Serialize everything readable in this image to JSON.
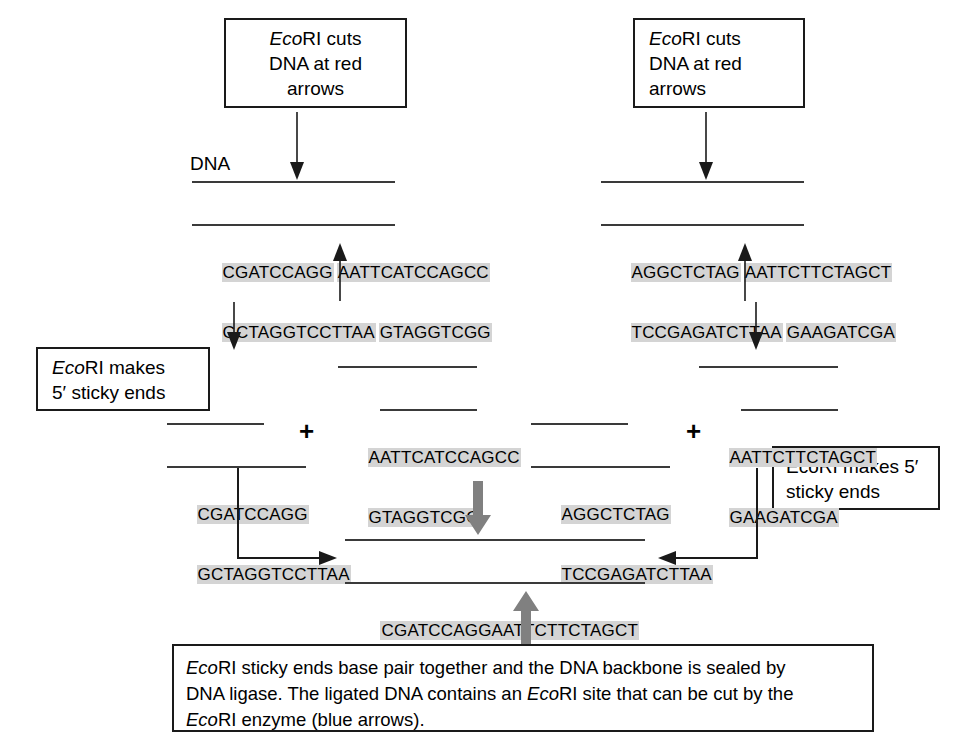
{
  "figure": {
    "title_label": "DNA",
    "colors": {
      "ink": "#1a1a1a",
      "sequence_highlight": "#d4d4d4",
      "thick_arrow": "#808080",
      "backbone": "#3a3a3a"
    }
  },
  "boxes": {
    "top_left": {
      "line1_italic": "Eco",
      "line1_rest": "RI cuts",
      "line2": "DNA at red",
      "line3": "arrows"
    },
    "top_right": {
      "line1_italic": "Eco",
      "line1_rest": "RI cuts",
      "line2": "DNA at red",
      "line3": "arrows"
    },
    "left_middle": {
      "line1_italic": "Eco",
      "line1_rest": "RI makes",
      "line2": "5′ sticky ends"
    },
    "right_middle": {
      "line1": "EcoRI makes 5′",
      "line2": "sticky ends"
    },
    "caption": {
      "l1_italic": "Eco",
      "l1_a": "RI sticky ends base pair together and the DNA backbone is sealed by",
      "l2_a": "DNA ligase. The ligated DNA contains an ",
      "l2_italic": "Eco",
      "l2_b": "RI site that can be cut by the",
      "l3_italic": "Eco",
      "l3_a": "RI enzyme (blue arrows)."
    }
  },
  "sequences": {
    "top_left_duplex": {
      "label": "DNA",
      "top_left_part": "CGATCCAGG",
      "top_right_part": "AATTCATCCAGCC",
      "bottom_left_part": "GCTAGGTCCTTAA",
      "bottom_right_part": "GTAGGTCGG"
    },
    "top_right_duplex": {
      "top_left_part": "AGGCTCTAG",
      "top_right_part": "AATTCTTCTAGCT",
      "bottom_left_part": "TCCGAGATCTTAA",
      "bottom_right_part": "GAAGATCGA"
    },
    "fragment_left_sticky": {
      "top": "AATTCATCCAGCC",
      "bottom": "GTAGGTCGG"
    },
    "fragment_right_sticky": {
      "top": "AATTCTTCTAGCT",
      "bottom": "GAAGATCGA"
    },
    "fragment_left_blunt": {
      "top": "CGATCCAGG",
      "bottom": "GCTAGGTCCTTAA"
    },
    "fragment_right_blunt": {
      "top": "AGGCTCTAG",
      "bottom": "TCCGAGATCTTAA"
    },
    "ligated": {
      "top": "CGATCCAGGAATTCTTCTAGCT",
      "bottom": "GCTAGGTCCTTAAGAAGATCGA"
    }
  },
  "symbols": {
    "plus_left": "+",
    "plus_right": "+"
  }
}
